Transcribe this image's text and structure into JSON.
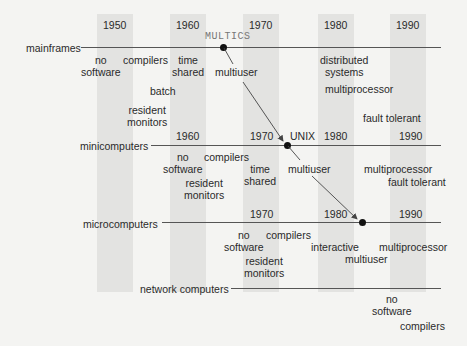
{
  "decades": {
    "d1950": "1950",
    "d1960": "1960",
    "d1970": "1970",
    "d1980": "1980",
    "d1990": "1990"
  },
  "rows": {
    "mainframes": {
      "label": "mainframes",
      "milestone": "MULTICS",
      "features": {
        "no_software": [
          "no",
          "software"
        ],
        "compilers": "compilers",
        "time_shared": [
          "time",
          "shared"
        ],
        "multiuser": "multiuser",
        "batch": "batch",
        "resident_monitors": [
          "resident",
          "monitors"
        ],
        "distributed_systems": [
          "distributed",
          "systems"
        ],
        "multiprocessor": "multiprocessor",
        "fault_tolerant": "fault tolerant"
      }
    },
    "minicomputers": {
      "label": "minicomputers",
      "milestone": "UNIX",
      "years": [
        "1960",
        "1970",
        "1980",
        "1990"
      ],
      "features": {
        "no_software": [
          "no",
          "software"
        ],
        "compilers": "compilers",
        "time_shared": [
          "time",
          "shared"
        ],
        "resident_monitors": [
          "resident",
          "monitors"
        ],
        "multiuser": "multiuser",
        "multiprocessor": "multiprocessor",
        "fault_tolerant": "fault tolerant"
      }
    },
    "microcomputers": {
      "label": "microcomputers",
      "years": [
        "1970",
        "1980",
        "1990"
      ],
      "features": {
        "no_software": [
          "no",
          "software"
        ],
        "compilers": "compilers",
        "interactive": "interactive",
        "multiuser": "multiuser",
        "multiprocessor": "multiprocessor",
        "resident_monitors": [
          "resident",
          "monitors"
        ]
      }
    },
    "network_computers": {
      "label": "network computers",
      "features": {
        "no_software": [
          "no",
          "software"
        ],
        "compilers": "compilers"
      }
    }
  },
  "colors": {
    "background": "#f4f4f2",
    "band": "#e3e3e1",
    "line": "#555555",
    "dot": "#111111",
    "text": "#2a2a2a"
  }
}
